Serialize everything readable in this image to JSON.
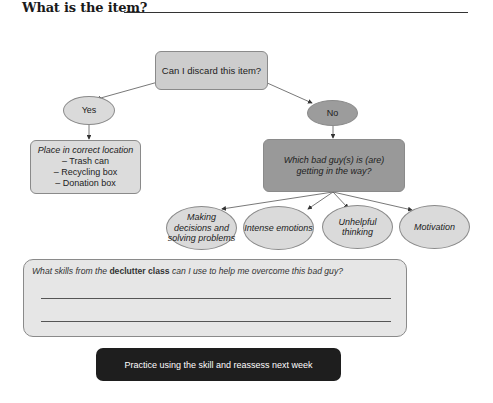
{
  "header": {
    "title": "What is the item?",
    "answer_value": ""
  },
  "flowchart": {
    "question": "Can I discard this item?",
    "yes_label": "Yes",
    "no_label": "No",
    "yes_action": {
      "heading": "Place in correct location",
      "items": [
        "– Trash can",
        "– Recycling box",
        "– Donation box"
      ]
    },
    "no_question": "Which bad guy(s) is (are) getting in the way?",
    "bad_guys": [
      {
        "label": "Making decisions and solving problems"
      },
      {
        "label": "Intense emotions"
      },
      {
        "label": "Unhelpful thinking"
      },
      {
        "label": "Motivation"
      }
    ]
  },
  "skills": {
    "prompt_pre": "What skills from the ",
    "prompt_bold": "declutter class",
    "prompt_post": " can I use to help me overcome this bad guy?",
    "answer_lines": [
      "",
      ""
    ]
  },
  "footer": {
    "practice_label": "Practice using the skill and reassess next week"
  },
  "colors": {
    "question_box": "#cdcdcd",
    "yes_ellipse": "#dadada",
    "no_ellipse": "#9c9c9c",
    "bad_guy_box": "#999999",
    "practice_box": "#1e1e1e"
  }
}
